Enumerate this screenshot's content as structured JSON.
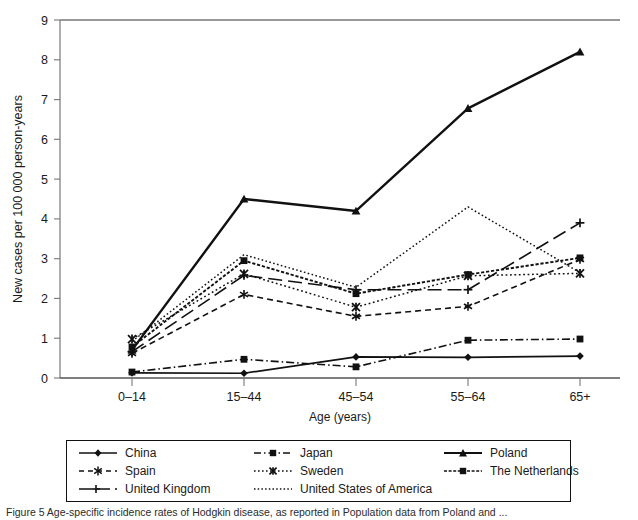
{
  "chart_data": {
    "type": "line",
    "title": "",
    "xlabel": "Age (years)",
    "ylabel": "New cases per 100 000 person-years",
    "categories": [
      "0–14",
      "15–44",
      "45–54",
      "55–64",
      "65+"
    ],
    "ylim": [
      0,
      9
    ],
    "yticks": [
      0,
      1,
      2,
      3,
      4,
      5,
      6,
      7,
      8,
      9
    ],
    "grid": false,
    "legend_position": "below-plot",
    "series": [
      {
        "name": "China",
        "values": [
          0.13,
          0.12,
          0.53,
          0.52,
          0.55
        ]
      },
      {
        "name": "Japan",
        "values": [
          0.15,
          0.47,
          0.28,
          0.95,
          0.98
        ]
      },
      {
        "name": "Poland",
        "values": [
          0.7,
          4.5,
          4.2,
          6.78,
          8.2
        ]
      },
      {
        "name": "Spain",
        "values": [
          0.62,
          2.1,
          1.55,
          1.8,
          2.98
        ]
      },
      {
        "name": "Sweden",
        "values": [
          0.98,
          2.62,
          1.78,
          2.57,
          2.63
        ]
      },
      {
        "name": "The Netherlands",
        "values": [
          0.78,
          2.95,
          2.12,
          2.6,
          3.02
        ]
      },
      {
        "name": "United Kingdom",
        "values": [
          0.66,
          2.58,
          2.22,
          2.22,
          3.9
        ]
      },
      {
        "name": "United States of America",
        "values": [
          0.92,
          3.1,
          2.28,
          4.3,
          2.65
        ]
      }
    ]
  },
  "yaxis": {
    "title": "New cases per 100 000 person-years",
    "ticks": [
      "0",
      "1",
      "2",
      "3",
      "4",
      "5",
      "6",
      "7",
      "8",
      "9"
    ]
  },
  "xaxis": {
    "title": "Age (years)",
    "ticks": [
      "0–14",
      "15–44",
      "45–54",
      "55–64",
      "65+"
    ]
  },
  "legend": {
    "entries": [
      {
        "label": "China",
        "style": "solid-diamond"
      },
      {
        "label": "Japan",
        "style": "dashdot-square"
      },
      {
        "label": "Poland",
        "style": "solid-triangle"
      },
      {
        "label": "Spain",
        "style": "dashed-asterisk"
      },
      {
        "label": "Sweden",
        "style": "dotted-x"
      },
      {
        "label": "The Netherlands",
        "style": "fine-dash-square"
      },
      {
        "label": "United Kingdom",
        "style": "longdash-plus"
      },
      {
        "label": "United States of America",
        "style": "dotted-plain"
      }
    ]
  },
  "caption": {
    "text": "Figure 5  Age-specific incidence rates of Hodgkin disease, as reported in Population data from Poland and ..."
  },
  "colors": {
    "ink": "#1a1a1a",
    "axis": "#555555",
    "frame": "#111111",
    "background": "#ffffff"
  }
}
